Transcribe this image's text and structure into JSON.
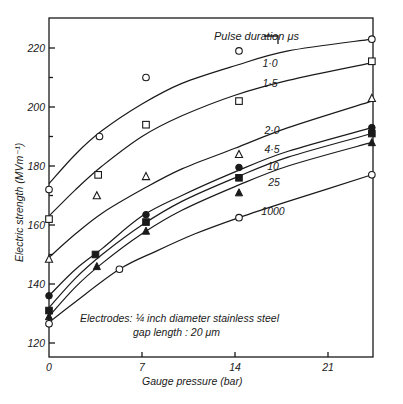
{
  "chart_data": {
    "type": "line",
    "title": "",
    "xlabel": "Gauge pressure (bar)",
    "ylabel": "Electric strength (MVm⁻¹)",
    "xlim": [
      0,
      24.5
    ],
    "ylim": [
      116,
      230
    ],
    "x_ticks": [
      0,
      7,
      14,
      21
    ],
    "y_ticks": [
      120,
      140,
      160,
      180,
      200,
      220
    ],
    "y_minor_ticks": [
      130,
      150,
      170,
      190,
      210
    ],
    "grid": false,
    "legend_title": "Pulse duration μs",
    "annotation": {
      "line1": "Electrodes: ¼ inch diameter stainless steel",
      "line2": "gap length : 20 μm"
    },
    "series": [
      {
        "name": "1·0",
        "label": "1·0",
        "marker": "open-circle",
        "points": [
          [
            0,
            172
          ],
          [
            3.8,
            190
          ],
          [
            7.3,
            210
          ],
          [
            14.3,
            219
          ],
          [
            24.3,
            223
          ]
        ],
        "curve": [
          [
            0,
            174
          ],
          [
            2,
            184
          ],
          [
            4,
            192
          ],
          [
            7,
            201
          ],
          [
            10,
            208
          ],
          [
            14,
            214
          ],
          [
            18,
            219
          ],
          [
            24.3,
            223
          ]
        ]
      },
      {
        "name": "1·5",
        "label": "1·5",
        "marker": "open-square",
        "points": [
          [
            0,
            162
          ],
          [
            3.7,
            177
          ],
          [
            7.3,
            194
          ],
          [
            14.3,
            202
          ],
          [
            24.3,
            215.5
          ]
        ],
        "curve": [
          [
            0,
            163
          ],
          [
            2,
            172
          ],
          [
            4,
            180
          ],
          [
            7,
            190
          ],
          [
            10,
            197
          ],
          [
            14,
            204
          ],
          [
            18,
            209
          ],
          [
            24.3,
            215
          ]
        ]
      },
      {
        "name": "2·0",
        "label": "2·0",
        "marker": "open-triangle",
        "points": [
          [
            0,
            148.5
          ],
          [
            3.6,
            170
          ],
          [
            7.3,
            176.5
          ],
          [
            14.3,
            184
          ],
          [
            24.3,
            203
          ]
        ],
        "curve": [
          [
            0,
            149
          ],
          [
            2,
            157
          ],
          [
            4,
            164
          ],
          [
            7,
            172
          ],
          [
            10,
            179
          ],
          [
            14,
            186
          ],
          [
            18,
            193
          ],
          [
            24.3,
            202
          ]
        ]
      },
      {
        "name": "4·5",
        "label": "4·5",
        "marker": "filled-circle",
        "points": [
          [
            0,
            136
          ],
          [
            7.3,
            163.5
          ],
          [
            14.3,
            179.5
          ],
          [
            24.3,
            193
          ]
        ],
        "curve": [
          [
            0,
            136
          ],
          [
            2,
            145
          ],
          [
            4,
            152
          ],
          [
            7,
            163
          ],
          [
            10,
            170
          ],
          [
            14,
            178
          ],
          [
            18,
            185
          ],
          [
            24.3,
            193
          ]
        ]
      },
      {
        "name": "10",
        "label": "10",
        "marker": "filled-square",
        "points": [
          [
            0,
            131
          ],
          [
            3.5,
            150
          ],
          [
            7.3,
            161
          ],
          [
            14.3,
            176
          ],
          [
            24.3,
            191
          ]
        ],
        "curve": [
          [
            0,
            132
          ],
          [
            2,
            142
          ],
          [
            4,
            150
          ],
          [
            7,
            160
          ],
          [
            10,
            168
          ],
          [
            14,
            176
          ],
          [
            18,
            183
          ],
          [
            24.3,
            191
          ]
        ]
      },
      {
        "name": "25",
        "label": "25",
        "marker": "filled-triangle",
        "points": [
          [
            0,
            129
          ],
          [
            3.6,
            146
          ],
          [
            7.3,
            158
          ],
          [
            14.3,
            171
          ],
          [
            24.3,
            188
          ]
        ],
        "curve": [
          [
            0,
            129
          ],
          [
            2,
            139
          ],
          [
            4,
            147
          ],
          [
            7,
            157
          ],
          [
            10,
            165
          ],
          [
            14,
            173
          ],
          [
            18,
            180
          ],
          [
            24.3,
            188
          ]
        ]
      },
      {
        "name": "1000",
        "label": "1000",
        "marker": "open-circle",
        "points": [
          [
            0,
            126.5
          ],
          [
            5.3,
            145
          ],
          [
            14.3,
            162.5
          ],
          [
            24.3,
            177
          ]
        ],
        "curve": [
          [
            0,
            127
          ],
          [
            2,
            134
          ],
          [
            5.3,
            145
          ],
          [
            8,
            151
          ],
          [
            11,
            157
          ],
          [
            14.3,
            162.5
          ],
          [
            18,
            168
          ],
          [
            24.3,
            177
          ]
        ]
      }
    ],
    "label_positions": [
      {
        "series": "1·0",
        "x": 270,
        "y": 67
      },
      {
        "series": "1·5",
        "x": 270,
        "y": 87
      },
      {
        "series": "2·0",
        "x": 272,
        "y": 134
      },
      {
        "series": "4·5",
        "x": 272,
        "y": 153
      },
      {
        "series": "10",
        "x": 273,
        "y": 170
      },
      {
        "series": "25",
        "x": 274,
        "y": 186
      },
      {
        "series": "1000",
        "x": 273,
        "y": 215
      }
    ]
  }
}
